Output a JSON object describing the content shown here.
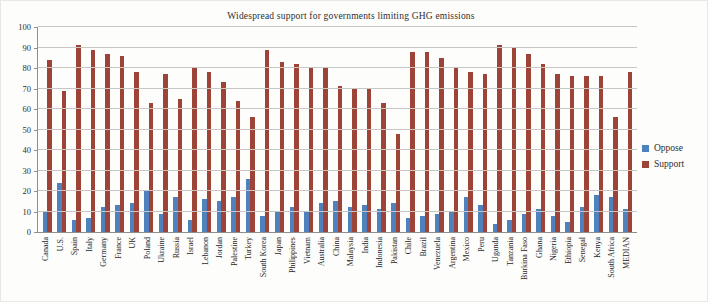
{
  "figure": {
    "title": "Widespread support for governments limiting GHG emissions"
  },
  "legend": {
    "items": [
      {
        "label": "Oppose",
        "color": "#4f81bd"
      },
      {
        "label": "Support",
        "color": "#9e4338"
      }
    ]
  },
  "colors": {
    "gridline": "#c7c6c3",
    "axis": "#8f8f8f",
    "oppose": "#4f81bd",
    "support": "#9e4338"
  },
  "chart_data": {
    "type": "bar",
    "title": "Widespread support for governments limiting GHG emissions",
    "xlabel": "",
    "ylabel": "",
    "ylim": [
      0,
      100
    ],
    "yticks": [
      0,
      10,
      20,
      30,
      40,
      50,
      60,
      70,
      80,
      90,
      100
    ],
    "grid": true,
    "legend_position": "right",
    "categories": [
      "Canada",
      "U.S.",
      "Spain",
      "Italy",
      "Germany",
      "France",
      "UK",
      "Poland",
      "Ukraine",
      "Russia",
      "Israel",
      "Lebanon",
      "Jordan",
      "Palestine",
      "Turkey",
      "South Korea",
      "Japan",
      "Philippines",
      "Vietnam",
      "Australia",
      "China",
      "Malaysia",
      "India",
      "Indonesia",
      "Pakistan",
      "Chile",
      "Brazil",
      "Venezuela",
      "Argentina",
      "Mexico",
      "Peru",
      "Uganda",
      "Tanzania",
      "Burkina Faso",
      "Ghana",
      "Nigeria",
      "Ethiopia",
      "Senegal",
      "Kenya",
      "South Africa",
      "MEDIAN"
    ],
    "series": [
      {
        "name": "Oppose",
        "color": "#4f81bd",
        "values": [
          10,
          24,
          6,
          7,
          12,
          13,
          14,
          20,
          9,
          17,
          6,
          16,
          15,
          17,
          26,
          8,
          10,
          12,
          10,
          14,
          15,
          12,
          13,
          11,
          14,
          7,
          8,
          9,
          10,
          17,
          13,
          4,
          6,
          9,
          11,
          8,
          5,
          12,
          18,
          17,
          11
        ]
      },
      {
        "name": "Support",
        "color": "#9e4338",
        "values": [
          84,
          69,
          91,
          89,
          87,
          86,
          78,
          63,
          77,
          65,
          80,
          78,
          73,
          64,
          56,
          89,
          83,
          82,
          80,
          80,
          71,
          70,
          70,
          63,
          48,
          88,
          88,
          85,
          80,
          78,
          77,
          91,
          90,
          87,
          82,
          77,
          76,
          76,
          76,
          56,
          78
        ]
      }
    ]
  }
}
